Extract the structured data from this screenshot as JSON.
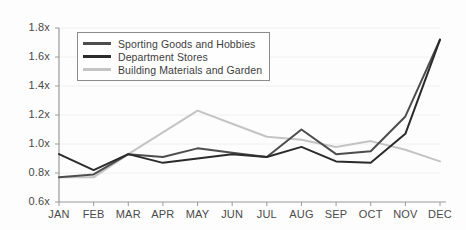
{
  "chart_data": {
    "type": "line",
    "title": "",
    "subtitle": "",
    "xlabel": "",
    "ylabel": "",
    "categories": [
      "JAN",
      "FEB",
      "MAR",
      "APR",
      "MAY",
      "JUN",
      "JUL",
      "AUG",
      "SEP",
      "OCT",
      "NOV",
      "DEC"
    ],
    "ylim": [
      0.6,
      1.8
    ],
    "ytick_labels": [
      "1.8x",
      "1.6x",
      "1.4x",
      "1.2x",
      "1.0x",
      "0.8x",
      "0.6x"
    ],
    "ytick_values": [
      1.8,
      1.6,
      1.4,
      1.2,
      1.0,
      0.8,
      0.6
    ],
    "grid": true,
    "legend_position": "upper-left-inside",
    "series": [
      {
        "name": "Sporting Goods and Hobbies",
        "color": "#4d4d4d",
        "values": [
          0.77,
          0.79,
          0.93,
          0.91,
          0.97,
          0.94,
          0.91,
          1.1,
          0.93,
          0.95,
          1.19,
          1.72
        ]
      },
      {
        "name": "Department Stores",
        "color": "#2b2b2b",
        "values": [
          0.93,
          0.82,
          0.93,
          0.87,
          0.9,
          0.93,
          0.91,
          0.98,
          0.88,
          0.87,
          1.07,
          1.72
        ]
      },
      {
        "name": "Building Materials and Garden",
        "color": "#c4c4c4",
        "values": [
          0.77,
          0.77,
          0.93,
          1.08,
          1.23,
          1.14,
          1.05,
          1.03,
          0.98,
          1.02,
          0.96,
          0.88
        ]
      }
    ]
  },
  "axis": {
    "line_color": "#9a9a9a",
    "grid_color": "#f0f0f0",
    "tick_color": "#9a9a9a"
  }
}
